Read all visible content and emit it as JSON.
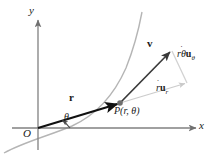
{
  "figure": {
    "kind": "polar-velocity-diagram",
    "background_color": "#ffffff",
    "axes": {
      "x_label": "x",
      "y_label": "y",
      "origin_label": "O",
      "axis_color": "#808080",
      "x_axis": {
        "x1": 12,
        "y1": 128,
        "x2": 198,
        "y2": 128
      },
      "y_axis": {
        "x1": 38,
        "y1": 148,
        "x2": 38,
        "y2": 18
      }
    },
    "curve": {
      "name": "trajectory-curve",
      "color": "#b3b3b3",
      "path": "M 4 153 C 24 142, 48 136, 72 126 C 96 115, 114 95, 126 68 C 134 48, 139 28, 142 12"
    },
    "position_vector": {
      "label": "r",
      "color": "#111111",
      "from": {
        "x": 38,
        "y": 128
      },
      "to": {
        "x": 120,
        "y": 103
      }
    },
    "velocity_vector": {
      "label": "v",
      "color": "#3a3a3a",
      "from": {
        "x": 120,
        "y": 103
      },
      "to": {
        "x": 172,
        "y": 50
      }
    },
    "components": {
      "radial": {
        "label_parts": {
          "scalar": "r",
          "dot": "˙",
          "unit": "u",
          "sub": "r"
        },
        "label_text": "ṙuᵣ",
        "color": "#c9c9c9",
        "from": {
          "x": 120,
          "y": 103
        },
        "to": {
          "x": 187,
          "y": 83
        }
      },
      "transverse": {
        "label_parts": {
          "scalar": "rθ",
          "dot": "˙",
          "unit": "u",
          "sub": "θ"
        },
        "label_text": "rθ̇uθ",
        "color": "#c9c9c9",
        "from": {
          "x": 187,
          "y": 83
        },
        "to": {
          "x": 172,
          "y": 50
        }
      },
      "parallelogram_side": {
        "from": {
          "x": 120,
          "y": 103
        },
        "to": {
          "x": 172,
          "y": 50
        },
        "color": "#d8d8d8"
      }
    },
    "point": {
      "name": "point-P",
      "label": "P(r, θ)",
      "marker_color": "#6e6e6e",
      "x": 120,
      "y": 103,
      "label_x": 116,
      "label_y": 106
    },
    "angle": {
      "label": "θ",
      "arc_color": "#4a4a4a",
      "label_x": 64,
      "label_y": 115,
      "arc_path": "M 60 128 A 22 22 0 0 0 57 121"
    },
    "labels": {
      "y_axis_pos": {
        "x": 30,
        "y": 8
      },
      "x_axis_pos": {
        "x": 200,
        "y": 122
      },
      "origin_pos": {
        "x": 24,
        "y": 130
      },
      "r_vector_pos": {
        "x": 70,
        "y": 96
      },
      "v_vector_pos": {
        "x": 148,
        "y": 41
      },
      "radial_comp_pos": {
        "x": 157,
        "y": 86
      },
      "transverse_comp_pos": {
        "x": 178,
        "y": 52
      }
    }
  }
}
